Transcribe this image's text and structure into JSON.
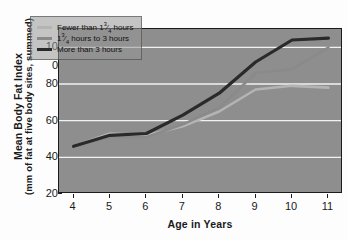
{
  "chart_data": {
    "type": "line",
    "title": "",
    "xlabel": "Age in Years",
    "ylabel": "Mean Body Fat Index",
    "ylabel_sub": "(mm of fat at five body sites, summed)",
    "x": [
      4,
      5,
      6,
      7,
      8,
      9,
      10,
      11
    ],
    "categories": [
      "4",
      "5",
      "6",
      "7",
      "8",
      "9",
      "10",
      "11"
    ],
    "xlim": [
      3.6,
      11.4
    ],
    "ylim": [
      20,
      110
    ],
    "yticks": [
      20,
      40,
      60,
      80,
      90,
      100
    ],
    "ytick_labels": [
      "20",
      "40",
      "60",
      "80",
      "0",
      "10"
    ],
    "grid": "horizontal-white",
    "legend_position": "upper-left-inside",
    "series": [
      {
        "name": "Fewer than 1¾ hours",
        "color": "#b4b4b4",
        "values": [
          46,
          53,
          52,
          57,
          65,
          77,
          79,
          78
        ]
      },
      {
        "name": "1¾ hours to 3 hours",
        "color": "#8a8a8a",
        "values": [
          46,
          51,
          51,
          58,
          67,
          86,
          88,
          100
        ]
      },
      {
        "name": "More than 3 hours",
        "color": "#2a2a2a",
        "values": [
          46,
          52,
          53,
          63,
          75,
          92,
          104,
          105
        ]
      }
    ]
  },
  "legend": {
    "items": [
      {
        "label_prefix": "Fewer than 1",
        "fraction_num": "3",
        "fraction_den": "4",
        "label_suffix": " hours"
      },
      {
        "label_prefix": "1",
        "fraction_num": "3",
        "fraction_den": "4",
        "label_suffix": " hours to 3 hours"
      },
      {
        "label_prefix": "More than 3 hours",
        "fraction_num": "",
        "fraction_den": "",
        "label_suffix": ""
      }
    ]
  }
}
